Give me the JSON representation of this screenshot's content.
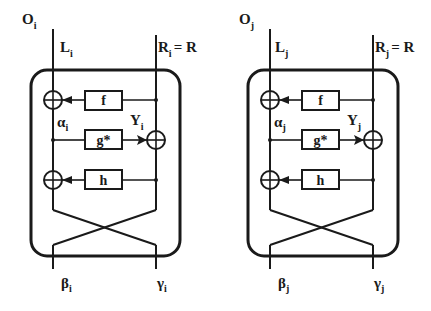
{
  "diagram": {
    "type": "block-diagram",
    "colors": {
      "stroke": "#1a1a1a",
      "background": "#ffffff"
    },
    "nodes": [
      {
        "id": "i",
        "outer_label": "O",
        "outer_sub": "i",
        "left_input": "L",
        "left_input_sub": "i",
        "right_input": "R",
        "right_input_sub": "i",
        "right_input_eq": "= R",
        "alpha": "α",
        "alpha_sub": "i",
        "y": "Y",
        "y_sub": "i",
        "f_label": "f",
        "g_label": "g*",
        "h_label": "h",
        "beta": "β",
        "beta_sub": "i",
        "gamma": "γ",
        "gamma_sub": "i"
      },
      {
        "id": "j",
        "outer_label": "O",
        "outer_sub": "j",
        "left_input": "L",
        "left_input_sub": "j",
        "right_input": "R",
        "right_input_sub": "j",
        "right_input_eq": "= R",
        "alpha": "α",
        "alpha_sub": "j",
        "y": "Y",
        "y_sub": "j",
        "f_label": "f",
        "g_label": "g*",
        "h_label": "h",
        "beta": "β",
        "beta_sub": "j",
        "gamma": "γ",
        "gamma_sub": "j"
      }
    ],
    "edges": [
      "R -> f -> XOR(L)",
      "α -> g* -> XOR(R) = Y",
      "R -> h -> XOR(L)",
      "cross: left lane -> γ, right lane -> β"
    ]
  }
}
